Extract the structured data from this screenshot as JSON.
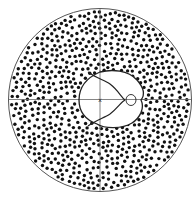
{
  "figure": {
    "width": 196,
    "height": 198,
    "disc": {
      "cx": 100,
      "cy": 100,
      "r": 91.5,
      "stroke": "#555555"
    },
    "axes": {
      "color": "#666666",
      "horizontal_y": 99.5,
      "vertical_x": 100
    },
    "center_mark": "x",
    "dots": {
      "count": 760,
      "radius": 1.7,
      "color": "#111111",
      "seed": 7,
      "min_spacing": 4.6,
      "exclusion": {
        "cx": 111,
        "cy": 99,
        "rx": 35,
        "ry": 29
      }
    },
    "central_region": {
      "outer_curve": "M 100 72 C 112 69, 128 70, 137 80 C 144 88, 145 95, 141 100 C 145 108, 140 118, 132 123 C 122 129, 105 129, 97 124 C 86 120, 79 112, 79 100 C 79 88, 86 78, 100 72 Z",
      "inner_curve_upper": "M 88 72 C 96 78, 104 80, 110 84 C 118 90, 121 97, 125 100",
      "inner_curve_lower": "M 88 126 C 96 120, 104 118, 110 114 C 118 108, 121 102, 125 100",
      "small_loop": {
        "cx": 131,
        "cy": 100,
        "rx": 5,
        "ry": 5.5
      },
      "stroke": "#222222"
    }
  }
}
